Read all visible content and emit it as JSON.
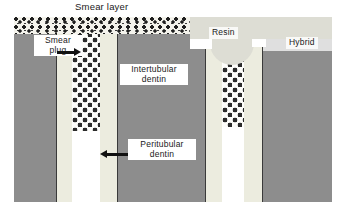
{
  "figure": {
    "labels": {
      "smear_layer": "Smear layer",
      "smear_plug": "Smear\nplug",
      "intertubular": "Intertubular\ndentin",
      "peritubular": "Peritubular\ndentin",
      "resin": "Resin",
      "hybrid": "Hybrid"
    },
    "arrows": [
      {
        "name": "smear-plug-arrow",
        "direction": "right"
      },
      {
        "name": "peritubular-dentin-arrow",
        "direction": "left"
      }
    ],
    "regions": [
      {
        "name": "smear-layer-band",
        "material": "smear layer"
      },
      {
        "name": "resin-band",
        "material": "resin"
      },
      {
        "name": "intertubular-dentin",
        "material": "intertubular dentin"
      },
      {
        "name": "peritubular-dentin",
        "material": "peritubular dentin"
      },
      {
        "name": "tubule-lumen",
        "material": "open dentinal tubule"
      },
      {
        "name": "smear-plug",
        "material": "smear plug"
      }
    ],
    "colors": {
      "intertubular_dentin": "#8d8d8d",
      "peritubular_dentin": "#ececdf",
      "lumen": "#ffffff",
      "smear_layer": "#f4f3ec",
      "resin": "#ddddd4",
      "ink": "#1a1a1a",
      "background": "#ffffff"
    }
  }
}
